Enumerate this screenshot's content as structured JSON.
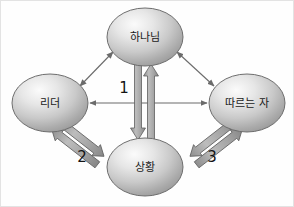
{
  "diagram": {
    "background_color": "#fefefe",
    "node_fill_light": "#f2f2f2",
    "node_fill_dark": "#9a9a9a",
    "node_stroke": "#6e6e6e",
    "thin_arrow_color": "#6b6b6b",
    "thick_arrow_fill": "#a8a8a8",
    "thick_arrow_stroke": "#5f5f5f",
    "label_color": "#1a1a1a",
    "nodes": [
      {
        "id": "god",
        "label": "하나님",
        "cx": 145,
        "cy": 37,
        "rx": 38,
        "ry": 29
      },
      {
        "id": "leader",
        "label": "리더",
        "cx": 50,
        "cy": 103,
        "rx": 38,
        "ry": 29
      },
      {
        "id": "follower",
        "label": "따르는 자",
        "cx": 247,
        "cy": 103,
        "rx": 38,
        "ry": 29
      },
      {
        "id": "situation",
        "label": "상황",
        "cx": 145,
        "cy": 167,
        "rx": 38,
        "ry": 29
      }
    ],
    "thin_edges": [
      {
        "id": "leader-god",
        "from": "leader",
        "to": "god",
        "style": "double-headed"
      },
      {
        "id": "god-follower",
        "from": "god",
        "to": "follower",
        "style": "double-headed"
      },
      {
        "id": "leader-follower",
        "from": "leader",
        "to": "follower",
        "style": "double-headed"
      }
    ],
    "thick_edges": [
      {
        "id": "edge-1",
        "number": "1",
        "from": "god",
        "to": "situation",
        "label_x": 124,
        "label_y": 88
      },
      {
        "id": "edge-2",
        "number": "2",
        "from": "leader",
        "to": "situation",
        "label_x": 82,
        "label_y": 157
      },
      {
        "id": "edge-3",
        "number": "3",
        "from": "follower",
        "to": "situation",
        "label_x": 212,
        "label_y": 157
      }
    ]
  }
}
